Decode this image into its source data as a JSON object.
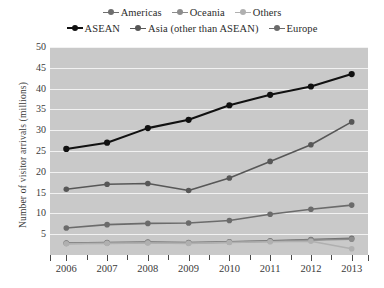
{
  "chart_data": {
    "type": "line",
    "title": "",
    "subtitle": "",
    "xlabel": "",
    "ylabel": "Number of visitor arrivals (millions)",
    "categories": [
      "2006",
      "2007",
      "2008",
      "2009",
      "2010",
      "2011",
      "2012",
      "2013"
    ],
    "x": [
      2006,
      2007,
      2008,
      2009,
      2010,
      2011,
      2012,
      2013
    ],
    "xlim": [
      2005.6,
      2013.4
    ],
    "ylim": [
      0,
      50
    ],
    "yticks": [
      5,
      10,
      15,
      20,
      25,
      30,
      35,
      40,
      45,
      50
    ],
    "ytick_labels": [
      "5",
      "10",
      "15",
      "20",
      "25",
      "30",
      "35",
      "40",
      "45",
      "50"
    ],
    "grid": true,
    "grid_axis": "y",
    "grid_color": "#f2f2f2",
    "plot_background": "#c9c9c9",
    "figure_background": "#ffffff",
    "legend_position": "above-plot",
    "legend_columns": 3,
    "series": [
      {
        "name": "Americas",
        "color": "#6e6e6e",
        "values": [
          2.9,
          3.0,
          3.1,
          3.0,
          3.2,
          3.4,
          3.7,
          4.0
        ]
      },
      {
        "name": "Oceania",
        "color": "#8c8c8c",
        "values": [
          2.8,
          2.9,
          3.0,
          2.9,
          3.1,
          3.3,
          3.6,
          3.8
        ]
      },
      {
        "name": "Others",
        "color": "#b0b0b0",
        "values": [
          2.7,
          2.8,
          2.9,
          2.8,
          3.0,
          3.2,
          3.3,
          1.5
        ]
      },
      {
        "name": "ASEAN",
        "color": "#111111",
        "values": [
          25.5,
          27.0,
          30.5,
          32.5,
          36.0,
          38.5,
          40.5,
          43.5
        ]
      },
      {
        "name": "Asia (other than ASEAN)",
        "color": "#575757",
        "values": [
          15.8,
          17.0,
          17.2,
          15.5,
          18.5,
          22.5,
          26.5,
          32.0
        ]
      },
      {
        "name": "Europe",
        "color": "#6b6b6b",
        "values": [
          6.5,
          7.3,
          7.6,
          7.7,
          8.3,
          9.8,
          11.0,
          12.0
        ]
      }
    ]
  },
  "legend": {
    "rows": [
      [
        "Americas",
        "Oceania",
        "Others"
      ],
      [
        "ASEAN",
        "Asia (other than ASEAN)",
        "Europe"
      ]
    ]
  }
}
